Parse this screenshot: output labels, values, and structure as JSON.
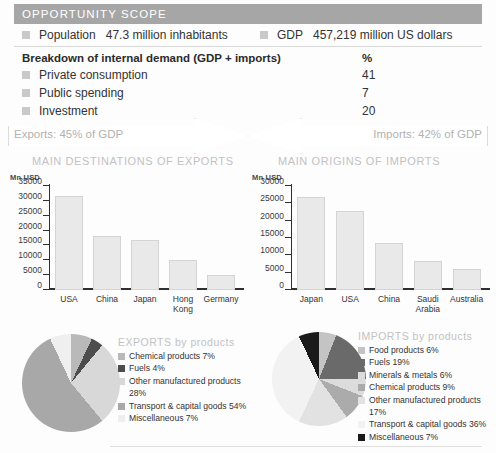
{
  "scope": {
    "header": "OPPORTUNITY SCOPE",
    "population": {
      "label": "Population",
      "value": "47.3 million inhabitants"
    },
    "gdp": {
      "label": "GDP",
      "value": "457,219 million US dollars"
    },
    "breakdown": {
      "title": "Breakdown of internal demand (GDP + imports)",
      "unit": "%",
      "rows": [
        {
          "label": "Private consumption",
          "value": "41"
        },
        {
          "label": "Public spending",
          "value": "7"
        },
        {
          "label": "Investment",
          "value": "20"
        }
      ]
    }
  },
  "arrows": {
    "exports": "Exports: 45% of GDP",
    "imports": "Imports: 42% of GDP"
  },
  "sections": {
    "exports_title": "MAIN DESTINATIONS OF EXPORTS",
    "imports_title": "MAIN ORIGINS OF IMPORTS"
  },
  "chart_data": [
    {
      "type": "bar",
      "title": "MAIN DESTINATIONS OF EXPORTS",
      "ylabel": "Mn USD",
      "xlabel": "",
      "categories": [
        "USA",
        "China",
        "Japan",
        "Hong Kong",
        "Germany"
      ],
      "values": [
        31500,
        18300,
        17000,
        10000,
        5000
      ],
      "ylim": [
        0,
        35000
      ],
      "yticks": [
        0,
        5000,
        10000,
        15000,
        20000,
        25000,
        30000,
        35000
      ],
      "yticklabels": [
        "0",
        "5000",
        "10000",
        "15000",
        "20000",
        "25000",
        "30000",
        "35000"
      ],
      "grid": false,
      "legend": "none",
      "bar_color": "#e9e9e9"
    },
    {
      "type": "bar",
      "title": "MAIN ORIGINS OF IMPORTS",
      "ylabel": "Mn USD",
      "xlabel": "",
      "categories": [
        "Japan",
        "USA",
        "China",
        "Saudi Arabia",
        "Australia"
      ],
      "values": [
        26700,
        22800,
        13600,
        8300,
        6100
      ],
      "ylim": [
        0,
        30000
      ],
      "yticks": [
        0,
        5000,
        10000,
        15000,
        20000,
        25000,
        30000
      ],
      "yticklabels": [
        "0",
        "5000",
        "10000",
        "15000",
        "20000",
        "25000",
        "30000"
      ],
      "grid": false,
      "legend": "none",
      "bar_color": "#e9e9e9"
    },
    {
      "type": "pie",
      "title": "EXPORTS by products",
      "legend_position": "right",
      "labels": [
        "Chemical products 7%",
        "Fuels 4%",
        "Other manufactured products 28%",
        "Transport & capital goods 54%",
        "Miscellaneous 7%"
      ],
      "categories": [
        "Chemical products",
        "Fuels",
        "Other manufactured products",
        "Transport & capital goods",
        "Miscellaneous"
      ],
      "values": [
        7,
        4,
        28,
        54,
        7
      ],
      "colors": [
        "#b9b9b9",
        "#4d4d4d",
        "#d8d8d8",
        "#a8a8a8",
        "#efefef"
      ]
    },
    {
      "type": "pie",
      "title": "IMPORTS by products",
      "legend_position": "right",
      "labels": [
        "Food products 6%",
        "Fuels 19%",
        "Minerals & metals 6%",
        "Chemical products 9%",
        "Other manufactured products 17%",
        "Transport & capital goods 36%",
        "Miscellaneous 7%"
      ],
      "categories": [
        "Food products",
        "Fuels",
        "Minerals & metals",
        "Chemical products",
        "Other manufactured products",
        "Transport & capital goods",
        "Miscellaneous"
      ],
      "values": [
        6,
        19,
        6,
        9,
        17,
        36,
        7
      ],
      "colors": [
        "#c4c4c4",
        "#6a6a6a",
        "#dcdcdc",
        "#ababab",
        "#e2e2e2",
        "#f2f2f2",
        "#1a1a1a"
      ]
    }
  ],
  "colors": {
    "header_bar": "#a6a6a6",
    "swatch": "#c9c9c9",
    "bar_fill": "#e9e9e9",
    "muted_title": "#c2c2c2",
    "axis": "#2f2f2f"
  }
}
